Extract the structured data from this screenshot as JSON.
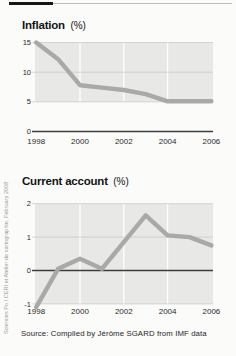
{
  "page": {
    "source_note": "Source: Compiled by Jérôme SGARD from IMF data",
    "credit_vertical": "Sciences Po / CERI et Atelier de cartographie, February 2008"
  },
  "colors": {
    "panel": "#e8e8e6",
    "hairline": "#c6c6c4",
    "white_grid": "#ffffff",
    "zero_axis": "#3c3c3c",
    "data_line": "#a9a9a7",
    "tick_text": "#2a2a2a",
    "accent_bar": "#161616"
  },
  "chart_data": [
    {
      "type": "line",
      "title": "Inflation",
      "unit": "(%)",
      "x": [
        1998,
        1999,
        2000,
        2001,
        2002,
        2003,
        2004,
        2005,
        2006
      ],
      "values": [
        15,
        12.2,
        7.8,
        7.4,
        7.0,
        6.3,
        5.1,
        5.1,
        5.1
      ],
      "y_ticks": [
        15,
        10,
        5,
        0
      ],
      "y_tick_labels": [
        "15",
        "10",
        "5",
        "0"
      ],
      "x_tick_labels": [
        "1998",
        "2000",
        "2002",
        "2004",
        "2006"
      ],
      "ylim": [
        0,
        15
      ],
      "grid": "horizontal hairlines at 5,10,15; vertical white gridlines at 2000,2002,2004; dark zero axis",
      "legend": "none"
    },
    {
      "type": "line",
      "title": "Current account",
      "unit": "(%)",
      "x": [
        1998,
        1999,
        2000,
        2001,
        2002,
        2003,
        2004,
        2005,
        2006
      ],
      "values": [
        -1.1,
        0.05,
        0.35,
        0.05,
        0.85,
        1.65,
        1.05,
        1.0,
        0.75
      ],
      "y_ticks": [
        2,
        1,
        0,
        -1
      ],
      "y_tick_labels": [
        "2",
        "1",
        "0",
        "-1"
      ],
      "x_tick_labels": [
        "1998",
        "2000",
        "2002",
        "2004",
        "2006"
      ],
      "ylim": [
        -1,
        2
      ],
      "grid": "horizontal hairlines at -1,1,2; vertical white gridlines at 2000,2002,2004; dark zero axis",
      "legend": "none"
    }
  ]
}
